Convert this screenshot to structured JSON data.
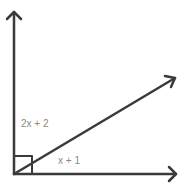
{
  "diagram": {
    "type": "angle-diagram",
    "rays": [
      "vertical",
      "diagonal",
      "horizontal"
    ],
    "right_angle_marker": true,
    "labels": {
      "upper_angle": "2x + 2",
      "lower_angle": "x + 1"
    },
    "colors": {
      "line": "#3a3a3a",
      "label": "#8a8a8a"
    }
  }
}
